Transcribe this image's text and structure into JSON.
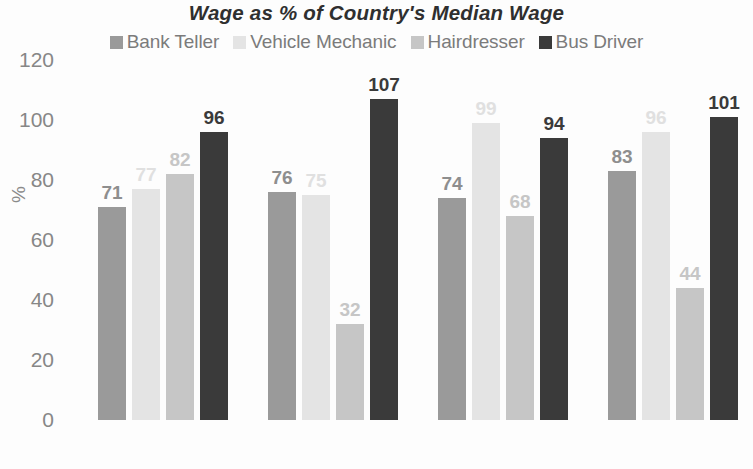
{
  "chart_data": {
    "type": "bar",
    "title": "Wage as % of Country's Median Wage",
    "xlabel": "",
    "ylabel": "%",
    "ylim": [
      0,
      120
    ],
    "yticks": [
      0,
      20,
      40,
      60,
      80,
      100,
      120
    ],
    "grid": false,
    "legend_position": "top",
    "categories": [
      "Singapore",
      "Australia",
      "US",
      "UK"
    ],
    "series": [
      {
        "name": "Bank Teller",
        "color": "#9a9a9a",
        "values": [
          71,
          76,
          74,
          83
        ]
      },
      {
        "name": "Vehicle Mechanic",
        "color": "#e4e4e4",
        "values": [
          77,
          75,
          99,
          96
        ]
      },
      {
        "name": "Hairdresser",
        "color": "#c6c6c6",
        "values": [
          82,
          32,
          68,
          44
        ]
      },
      {
        "name": "Bus Driver",
        "color": "#3a3a3a",
        "values": [
          96,
          107,
          94,
          101
        ]
      }
    ]
  },
  "axis": {
    "y_title": "%",
    "y_tick_labels": [
      "120",
      "100",
      "80",
      "60",
      "40",
      "20",
      "0"
    ]
  },
  "colors": {
    "title": "#2f2f2f",
    "tick": "#878787",
    "background": "#fdfdfd"
  }
}
